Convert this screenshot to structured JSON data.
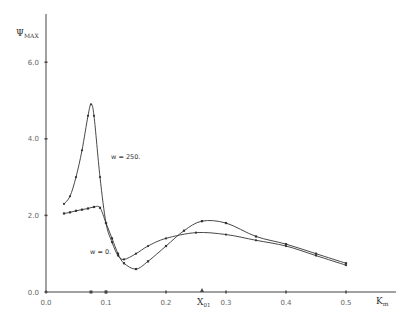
{
  "chart_data": {
    "type": "line",
    "title": "",
    "xlabel": "K_m",
    "ylabel": "Ψ_MAX",
    "xlim": [
      0.0,
      0.55
    ],
    "ylim": [
      0.0,
      7.5
    ],
    "x_ticks": [
      "0.0",
      "0.1",
      "0.2",
      "0.3",
      "0.4",
      "0.5"
    ],
    "y_ticks": [
      "0.0",
      "2.0",
      "4.0",
      "6.0"
    ],
    "grid": false,
    "annotations": [
      {
        "text": "w = 250.",
        "x": 0.108,
        "y": 3.6
      },
      {
        "text": "w = 0.",
        "x": 0.075,
        "y": 1.0
      },
      {
        "text": "X_01",
        "x": 0.26,
        "y": -0.55
      }
    ],
    "series": [
      {
        "name": "w = 250.",
        "x": [
          0.03,
          0.04,
          0.05,
          0.06,
          0.07,
          0.075,
          0.08,
          0.09,
          0.1,
          0.11,
          0.12,
          0.13,
          0.15,
          0.17,
          0.2,
          0.25,
          0.3,
          0.35,
          0.4,
          0.45,
          0.5
        ],
        "y": [
          2.3,
          2.5,
          3.0,
          3.7,
          4.6,
          4.9,
          4.6,
          3.0,
          1.8,
          1.3,
          0.95,
          0.85,
          1.0,
          1.2,
          1.4,
          1.55,
          1.5,
          1.35,
          1.2,
          0.95,
          0.7
        ]
      },
      {
        "name": "w = 0.",
        "x": [
          0.03,
          0.04,
          0.05,
          0.06,
          0.07,
          0.08,
          0.09,
          0.1,
          0.11,
          0.12,
          0.13,
          0.15,
          0.17,
          0.2,
          0.23,
          0.26,
          0.3,
          0.35,
          0.4,
          0.45,
          0.5
        ],
        "y": [
          2.05,
          2.08,
          2.12,
          2.15,
          2.18,
          2.22,
          2.2,
          1.8,
          1.4,
          1.0,
          0.75,
          0.6,
          0.8,
          1.2,
          1.6,
          1.85,
          1.8,
          1.45,
          1.25,
          1.0,
          0.75
        ]
      }
    ]
  },
  "labels": {
    "ylabel_main": "Ψ",
    "ylabel_sub": "MAX",
    "xlabel_main": "K",
    "xlabel_sub": "m",
    "x01_main": "X",
    "x01_sub": "01",
    "w250": "w = 250.",
    "w0": "w = 0."
  },
  "colors": {
    "axis": "#444444",
    "line": "#333333",
    "text": "#555555"
  }
}
